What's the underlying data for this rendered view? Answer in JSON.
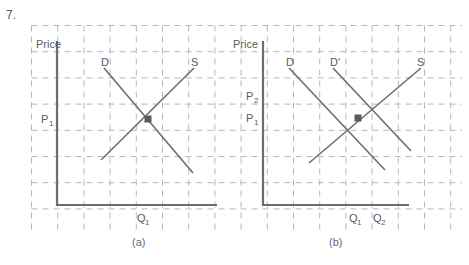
{
  "question": {
    "number": "7."
  },
  "colors": {
    "grid": "#b9b3c4",
    "curve": "#6d6d70",
    "axis": "#6d6d70",
    "text": "#5a5a5c",
    "background": "#ffffff",
    "point": "#5a5a5c"
  },
  "panels": [
    {
      "id": "panel-a",
      "caption": "(a)",
      "axis": {
        "y_label": "Price",
        "x_label": "Q",
        "x_label_sub": "1"
      },
      "price_ticks": [
        {
          "label": "P",
          "sub": "1"
        }
      ],
      "quantity_ticks": [
        {
          "label": "Q",
          "sub": "1"
        }
      ],
      "curves": [
        {
          "name": "D",
          "label": "D",
          "type": "demand"
        },
        {
          "name": "S",
          "label": "S",
          "type": "supply"
        }
      ],
      "equilibria": [
        {
          "name": "E1",
          "marked": true
        }
      ]
    },
    {
      "id": "panel-b",
      "caption": "(b)",
      "axis": {
        "y_label": "Price",
        "x_label": "Q",
        "x_label_sub": "1"
      },
      "price_ticks": [
        {
          "label": "P",
          "sub": "2"
        },
        {
          "label": "P",
          "sub": "1"
        }
      ],
      "quantity_ticks": [
        {
          "label": "Q",
          "sub": "1"
        },
        {
          "label": "Q",
          "sub": "2"
        }
      ],
      "curves": [
        {
          "name": "D",
          "label": "D",
          "type": "demand"
        },
        {
          "name": "Dprime",
          "label": "D'",
          "type": "demand-shifted"
        },
        {
          "name": "S",
          "label": "S",
          "type": "supply"
        }
      ],
      "equilibria": [
        {
          "name": "E1",
          "marked": true
        },
        {
          "name": "E2",
          "marked": false
        }
      ]
    }
  ],
  "chart_data": {
    "type": "line",
    "title": "",
    "xlabel": "Quantity",
    "ylabel": "Price",
    "grid": true,
    "legend": null,
    "panels": [
      {
        "panel": "(a)",
        "xlim": [
          0,
          10
        ],
        "ylim": [
          0,
          10
        ],
        "axis_origin": [
          57,
          205
        ],
        "series": [
          {
            "name": "D",
            "label": "D",
            "points": [
              [
                104,
                68
              ],
              [
                193,
                173
              ]
            ],
            "label_pos": [
              101,
              62
            ]
          },
          {
            "name": "S",
            "label": "S",
            "points": [
              [
                101,
                160
              ],
              [
                194,
                68
              ]
            ],
            "label_pos": [
              192,
              62
            ]
          }
        ],
        "equilibrium_points": [
          [
            148,
            119
          ]
        ],
        "price_markers": [
          {
            "label": "P1",
            "y": 119
          }
        ],
        "quantity_markers": [
          {
            "label": "Q1",
            "x": 148
          }
        ]
      },
      {
        "panel": "(b)",
        "xlim": [
          0,
          10
        ],
        "ylim": [
          0,
          10
        ],
        "axis_origin": [
          263,
          205
        ],
        "series": [
          {
            "name": "D",
            "label": "D",
            "points": [
              [
                289,
                68
              ],
              [
                385,
                170
              ]
            ],
            "label_pos": [
              286,
              62
            ]
          },
          {
            "name": "D'",
            "label": "D'",
            "points": [
              [
                333,
                68
              ],
              [
                411,
                151
              ]
            ],
            "label_pos": [
              330,
              62
            ]
          },
          {
            "name": "S",
            "label": "S",
            "points": [
              [
                309,
                163
              ],
              [
                421,
                68
              ]
            ],
            "label_pos": [
              419,
              62
            ]
          }
        ],
        "equilibrium_points": [
          [
            358,
            118
          ],
          [
            379,
            96
          ]
        ],
        "price_markers": [
          {
            "label": "P2",
            "y": 96
          },
          {
            "label": "P1",
            "y": 118
          }
        ],
        "quantity_markers": [
          {
            "label": "Q1",
            "x": 358
          },
          {
            "label": "Q2",
            "x": 379
          }
        ]
      }
    ]
  }
}
